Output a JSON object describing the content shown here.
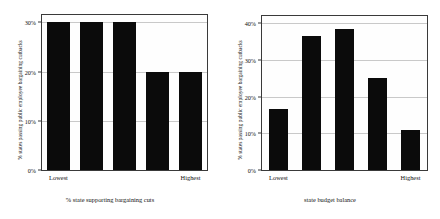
{
  "figure": {
    "background": "#ffffff",
    "bar_color": "#0b0b0b",
    "grid_color": "#c9c9c9",
    "frame_color": "#3a3a3a"
  },
  "chart_data": [
    {
      "type": "bar",
      "panel": "left",
      "title": "",
      "xlabel": "% state supporting bargaining cuts",
      "ylabel": "% states passing public employee bargaining cutbacks",
      "categories": [
        "1",
        "2",
        "3",
        "4",
        "5"
      ],
      "values": [
        30,
        30,
        30,
        20,
        20
      ],
      "ylim": [
        0,
        31.5
      ],
      "yticks": [
        0,
        10,
        20,
        30
      ],
      "ytick_labels": [
        "0%",
        "10%",
        "20%",
        "30%"
      ],
      "xtick_positions": [
        0,
        4
      ],
      "xtick_labels": [
        "Lowest",
        "Highest"
      ],
      "grid": true,
      "legend": "none"
    },
    {
      "type": "bar",
      "panel": "right",
      "title": "",
      "xlabel": "state budget balance",
      "ylabel": "% states passing public employee bargaining cutbacks",
      "categories": [
        "1",
        "2",
        "3",
        "4",
        "5"
      ],
      "values": [
        16.7,
        36.5,
        38.5,
        25.0,
        11.0
      ],
      "ylim": [
        0,
        42
      ],
      "yticks": [
        0,
        10,
        20,
        30,
        40
      ],
      "ytick_labels": [
        "0%",
        "10%",
        "20%",
        "30%",
        "40%"
      ],
      "xtick_positions": [
        0,
        4
      ],
      "xtick_labels": [
        "Lowest",
        "Highest"
      ],
      "grid": true,
      "legend": "none"
    }
  ]
}
